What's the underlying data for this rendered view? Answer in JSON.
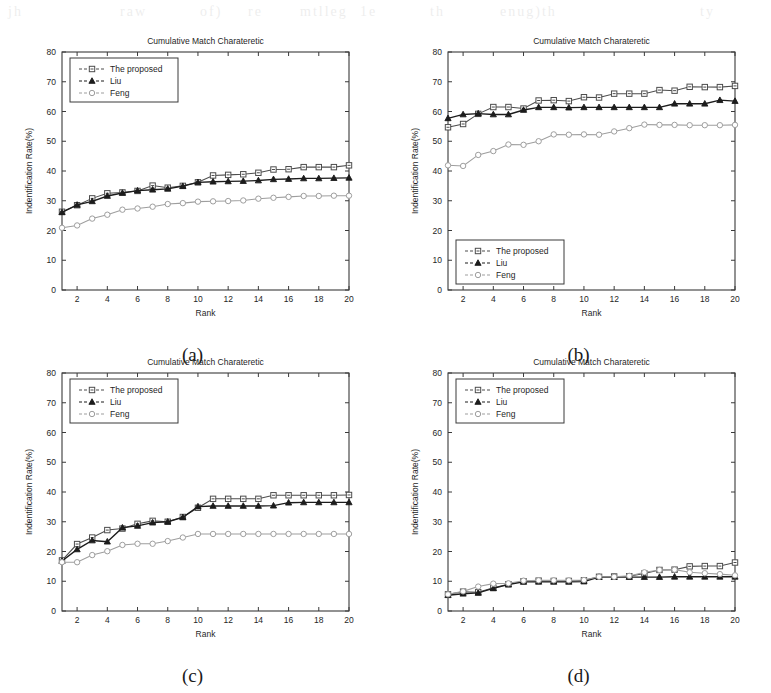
{
  "page": {
    "background": "#ffffff",
    "width": 771,
    "height": 693,
    "bleed_through_fragments": [
      "jh",
      "raw",
      "of)",
      "re",
      "mtlleg",
      "1e",
      "th",
      "enug)th",
      "ty"
    ]
  },
  "axes": {
    "y_ticks": [
      "0",
      "10",
      "20",
      "30",
      "40",
      "50",
      "60",
      "70",
      "80"
    ],
    "y_tick_values": [
      0,
      10,
      20,
      30,
      40,
      50,
      60,
      70,
      80
    ],
    "x_ticks": [
      "2",
      "4",
      "6",
      "8",
      "10",
      "12",
      "14",
      "16",
      "18",
      "20"
    ],
    "x_tick_values": [
      2,
      4,
      6,
      8,
      10,
      12,
      14,
      16,
      18,
      20
    ],
    "xlabel": "Rank",
    "ylabel": "Indentification Rate(%)",
    "title": "Cumulative Match Charateretic",
    "ylim": [
      0,
      80
    ],
    "xlim": [
      1,
      20
    ],
    "grid": false
  },
  "legend": {
    "entries": [
      "The proposed",
      "Liu",
      "Feng"
    ],
    "markers": [
      "square",
      "triangle",
      "circle"
    ],
    "colors": [
      "#4d4d4d",
      "#1c1c1c",
      "#9e9e9e"
    ]
  },
  "colors": {
    "proposed": "#4d4d4d",
    "liu": "#1c1c1c",
    "feng": "#9e9e9e",
    "axis": "#3a3a3a",
    "text": "#202020"
  },
  "panels": [
    {
      "id": "a",
      "caption": "(a)",
      "legend_position": "top-left"
    },
    {
      "id": "b",
      "caption": "(b)",
      "legend_position": "bottom-left"
    },
    {
      "id": "c",
      "caption": "(c)",
      "legend_position": "top-left"
    },
    {
      "id": "d",
      "caption": "(d)",
      "legend_position": "top-left"
    }
  ],
  "chart_data": [
    {
      "type": "line",
      "panel": "a",
      "caption": "(a)",
      "title": "Cumulative Match Charateretic",
      "xlabel": "Rank",
      "ylabel": "Indentification Rate(%)",
      "legend_position": "top-left",
      "xlim": [
        1,
        20
      ],
      "ylim": [
        0,
        80
      ],
      "grid": false,
      "x": [
        1,
        2,
        3,
        4,
        5,
        6,
        7,
        8,
        9,
        10,
        11,
        12,
        13,
        14,
        15,
        16,
        17,
        18,
        19,
        20
      ],
      "series": [
        {
          "name": "The proposed",
          "marker": "square",
          "color": "#4d4d4d",
          "values": [
            26.3,
            28.5,
            30.8,
            32.5,
            32.8,
            33.3,
            35.1,
            34.4,
            35.0,
            36.2,
            38.5,
            38.7,
            38.9,
            39.4,
            40.5,
            40.6,
            41.3,
            41.3,
            41.3,
            41.9
          ]
        },
        {
          "name": "Liu",
          "marker": "triangle",
          "color": "#1c1c1c",
          "values": [
            26.1,
            28.6,
            29.8,
            31.6,
            32.6,
            33.4,
            33.7,
            34.0,
            34.9,
            36.2,
            36.4,
            36.5,
            36.6,
            36.8,
            37.2,
            37.3,
            37.5,
            37.5,
            37.6,
            37.7
          ]
        },
        {
          "name": "Feng",
          "marker": "circle",
          "color": "#9e9e9e",
          "values": [
            20.9,
            21.7,
            24.0,
            25.3,
            27.0,
            27.4,
            28.0,
            28.9,
            29.2,
            29.7,
            29.8,
            29.9,
            30.1,
            30.7,
            31.0,
            31.3,
            31.6,
            31.6,
            31.7,
            31.7
          ]
        }
      ]
    },
    {
      "type": "line",
      "panel": "b",
      "caption": "(b)",
      "title": "Cumulative Match Charateretic",
      "xlabel": "Rank",
      "ylabel": "Indentification Rate(%)",
      "legend_position": "bottom-left",
      "xlim": [
        1,
        20
      ],
      "ylim": [
        0,
        80
      ],
      "grid": false,
      "x": [
        1,
        2,
        3,
        4,
        5,
        6,
        7,
        8,
        9,
        10,
        11,
        12,
        13,
        14,
        15,
        16,
        17,
        18,
        19,
        20
      ],
      "series": [
        {
          "name": "The proposed",
          "marker": "square",
          "color": "#4d4d4d",
          "values": [
            54.7,
            55.8,
            59.2,
            61.5,
            61.5,
            61.0,
            63.7,
            63.8,
            63.5,
            64.8,
            64.7,
            66.0,
            66.0,
            66.0,
            67.2,
            67.0,
            68.3,
            68.2,
            68.2,
            68.6
          ]
        },
        {
          "name": "Liu",
          "marker": "triangle",
          "color": "#1c1c1c",
          "values": [
            57.7,
            59.0,
            59.3,
            59.0,
            59.0,
            60.5,
            61.4,
            61.4,
            61.3,
            61.4,
            61.4,
            61.4,
            61.4,
            61.4,
            61.4,
            62.6,
            62.6,
            62.6,
            63.8,
            63.5
          ]
        },
        {
          "name": "Feng",
          "marker": "circle",
          "color": "#9e9e9e",
          "values": [
            41.9,
            41.7,
            45.4,
            46.7,
            48.9,
            48.8,
            50.0,
            52.3,
            52.2,
            52.3,
            52.2,
            53.3,
            54.4,
            55.6,
            55.5,
            55.5,
            55.4,
            55.4,
            55.4,
            55.5
          ]
        }
      ]
    },
    {
      "type": "line",
      "panel": "c",
      "caption": "(c)",
      "title": "Cumulative Match Charateretic",
      "xlabel": "Rank",
      "ylabel": "Indentification Rate(%)",
      "legend_position": "top-left",
      "xlim": [
        1,
        20
      ],
      "ylim": [
        0,
        80
      ],
      "grid": false,
      "x": [
        1,
        2,
        3,
        4,
        5,
        6,
        7,
        8,
        9,
        10,
        11,
        12,
        13,
        14,
        15,
        16,
        17,
        18,
        19,
        20
      ],
      "series": [
        {
          "name": "The proposed",
          "marker": "square",
          "color": "#4d4d4d",
          "values": [
            17.0,
            22.5,
            24.7,
            27.2,
            27.7,
            29.3,
            30.3,
            30.0,
            31.6,
            34.7,
            37.7,
            37.7,
            37.7,
            37.7,
            38.9,
            38.9,
            38.9,
            38.9,
            38.9,
            39.0
          ]
        },
        {
          "name": "Liu",
          "marker": "triangle",
          "color": "#1c1c1c",
          "values": [
            16.8,
            20.7,
            23.7,
            23.3,
            28.0,
            28.6,
            29.7,
            30.0,
            31.5,
            35.1,
            35.3,
            35.3,
            35.3,
            35.3,
            35.4,
            36.4,
            36.5,
            36.5,
            36.5,
            36.5
          ]
        },
        {
          "name": "Feng",
          "marker": "circle",
          "color": "#9e9e9e",
          "values": [
            16.4,
            16.4,
            18.8,
            20.1,
            22.2,
            22.6,
            22.6,
            23.5,
            24.7,
            25.9,
            25.9,
            25.9,
            25.9,
            25.9,
            25.9,
            25.9,
            25.9,
            25.9,
            25.9,
            25.9
          ]
        }
      ]
    },
    {
      "type": "line",
      "panel": "d",
      "caption": "(d)",
      "title": "Cumulative Match Charateretic",
      "xlabel": "Rank",
      "ylabel": "Indentification Rate(%)",
      "legend_position": "top-left",
      "xlim": [
        1,
        20
      ],
      "ylim": [
        0,
        80
      ],
      "grid": false,
      "x": [
        1,
        2,
        3,
        4,
        5,
        6,
        7,
        8,
        9,
        10,
        11,
        12,
        13,
        14,
        15,
        16,
        17,
        18,
        19,
        20
      ],
      "series": [
        {
          "name": "The proposed",
          "marker": "square",
          "color": "#4d4d4d",
          "values": [
            5.6,
            6.5,
            6.3,
            7.8,
            9.0,
            10.0,
            10.2,
            10.1,
            10.1,
            10.3,
            11.5,
            11.6,
            11.7,
            12.6,
            13.8,
            13.9,
            15.0,
            15.1,
            15.1,
            16.3
          ]
        },
        {
          "name": "Liu",
          "marker": "triangle",
          "color": "#1c1c1c",
          "values": [
            5.3,
            5.8,
            6.1,
            7.6,
            8.9,
            9.8,
            9.8,
            9.8,
            9.8,
            9.9,
            11.4,
            11.4,
            11.4,
            11.4,
            11.4,
            11.5,
            11.5,
            11.5,
            11.5,
            11.5
          ]
        },
        {
          "name": "Feng",
          "marker": "circle",
          "color": "#9e9e9e",
          "values": [
            5.6,
            6.6,
            8.2,
            9.2,
            9.3,
            10.2,
            10.3,
            10.3,
            10.3,
            10.4,
            11.5,
            11.5,
            11.8,
            13.0,
            13.8,
            13.9,
            13.0,
            12.7,
            12.4,
            12.0
          ]
        }
      ]
    }
  ]
}
